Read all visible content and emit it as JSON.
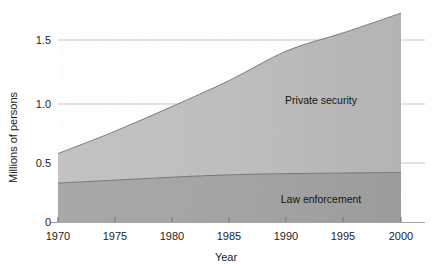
{
  "chart_data": {
    "type": "area",
    "title": "",
    "subtitle": "",
    "xlabel": "Year",
    "ylabel": "Millions of persons",
    "stacked": true,
    "grid": "horizontal",
    "legend_position": "inline-annotations",
    "xlim": [
      1970,
      2000
    ],
    "ylim": [
      0,
      1.8
    ],
    "x_ticks": [
      1970,
      1975,
      1980,
      1985,
      1990,
      1995,
      2000
    ],
    "x_tick_labels": [
      "1970",
      "1975",
      "1980",
      "1985",
      "1990",
      "1995",
      "2000"
    ],
    "y_ticks": [
      0,
      0.5,
      1.0,
      1.5
    ],
    "y_tick_labels": [
      "0",
      "0.5",
      "1.0",
      "1.5"
    ],
    "x": [
      1970,
      1975,
      1980,
      1985,
      1990,
      1995,
      2000
    ],
    "series": [
      {
        "name": "Law enforcement",
        "color": "#a3a3a3",
        "label_text": "Law enforcement",
        "values": [
          0.33,
          0.355,
          0.38,
          0.4,
          0.41,
          0.415,
          0.42
        ]
      },
      {
        "name": "Private security",
        "color": "#bcbcbc",
        "label_text": "Private security",
        "values": [
          0.25,
          0.415,
          0.6,
          0.8,
          1.04,
          1.19,
          1.35
        ]
      }
    ],
    "totals": [
      0.58,
      0.77,
      0.98,
      1.2,
      1.45,
      1.605,
      1.77
    ],
    "annotations": [
      {
        "text": "Private security",
        "x": 1993,
        "y": 1.0
      },
      {
        "text": "Law enforcement",
        "x": 1993,
        "y": 0.165
      }
    ]
  }
}
